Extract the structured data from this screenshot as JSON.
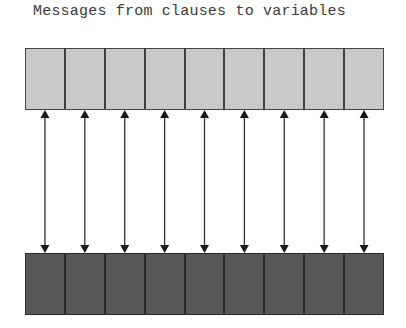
{
  "title": "Messages from clauses to variables",
  "diagram": {
    "top_row": {
      "role": "clauses",
      "cell_count": 9,
      "fill_color": "#c9c9c9",
      "border_color": "#444444"
    },
    "bottom_row": {
      "role": "variables",
      "cell_count": 9,
      "fill_color": "#575757",
      "border_color": "#2a2a2a"
    },
    "connections": {
      "count": 9,
      "type": "double-headed-arrow",
      "color": "#333333"
    }
  }
}
